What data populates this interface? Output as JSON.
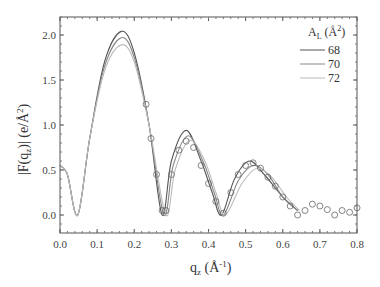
{
  "chart_data": {
    "type": "line",
    "title": "",
    "xlabel": "q_z (Å^-1)",
    "ylabel": "|F(q_z)| (e/Å^2)",
    "xlim": [
      0.0,
      0.8
    ],
    "ylim": [
      -0.2,
      2.2
    ],
    "x_ticks": [
      "0.0",
      "0.1",
      "0.2",
      "0.3",
      "0.4",
      "0.5",
      "0.6",
      "0.7",
      "0.8"
    ],
    "y_ticks": [
      "0.0",
      "0.5",
      "1.0",
      "1.5",
      "2.0"
    ],
    "grid": false,
    "legend": {
      "title": "A_L (Å^2)",
      "position": "upper right",
      "entries": [
        "68",
        "70",
        "72"
      ]
    },
    "series": [
      {
        "name": "68",
        "style": "line",
        "color": "#555555",
        "x": [
          0.0,
          0.02,
          0.048,
          0.08,
          0.12,
          0.165,
          0.2,
          0.24,
          0.275,
          0.3,
          0.34,
          0.38,
          0.41,
          0.435,
          0.47,
          0.51,
          0.55,
          0.6,
          0.64
        ],
        "y": [
          0.55,
          0.45,
          0.0,
          0.85,
          1.7,
          2.04,
          1.8,
          1.0,
          0.0,
          0.6,
          0.94,
          0.6,
          0.25,
          0.0,
          0.4,
          0.6,
          0.45,
          0.2,
          0.05
        ]
      },
      {
        "name": "70",
        "style": "line",
        "color": "#888888",
        "x": [
          0.0,
          0.02,
          0.048,
          0.08,
          0.12,
          0.165,
          0.2,
          0.24,
          0.28,
          0.305,
          0.345,
          0.385,
          0.415,
          0.44,
          0.48,
          0.52,
          0.56,
          0.6,
          0.64
        ],
        "y": [
          0.55,
          0.45,
          0.0,
          0.85,
          1.65,
          1.97,
          1.75,
          1.0,
          0.0,
          0.55,
          0.88,
          0.6,
          0.25,
          0.0,
          0.38,
          0.55,
          0.45,
          0.2,
          0.05
        ]
      },
      {
        "name": "72",
        "style": "line",
        "color": "#bbbbbb",
        "x": [
          0.0,
          0.02,
          0.048,
          0.08,
          0.12,
          0.165,
          0.2,
          0.24,
          0.285,
          0.31,
          0.35,
          0.39,
          0.42,
          0.445,
          0.49,
          0.53,
          0.57,
          0.61,
          0.645
        ],
        "y": [
          0.55,
          0.45,
          0.0,
          0.85,
          1.6,
          1.89,
          1.7,
          1.0,
          0.0,
          0.5,
          0.83,
          0.6,
          0.25,
          0.0,
          0.35,
          0.52,
          0.42,
          0.2,
          0.05
        ]
      },
      {
        "name": "data",
        "style": "scatter-open-circle",
        "color": "#666666",
        "x": [
          0.232,
          0.245,
          0.26,
          0.275,
          0.285,
          0.3,
          0.32,
          0.34,
          0.36,
          0.38,
          0.4,
          0.42,
          0.44,
          0.46,
          0.48,
          0.5,
          0.52,
          0.54,
          0.56,
          0.58,
          0.6,
          0.62,
          0.64,
          0.66,
          0.68,
          0.7,
          0.72,
          0.74,
          0.76,
          0.78,
          0.8
        ],
        "y": [
          1.23,
          0.85,
          0.45,
          0.05,
          0.05,
          0.45,
          0.72,
          0.82,
          0.75,
          0.55,
          0.35,
          0.15,
          0.02,
          0.25,
          0.45,
          0.55,
          0.58,
          0.52,
          0.42,
          0.32,
          0.2,
          0.1,
          0.0,
          0.05,
          0.12,
          0.1,
          0.06,
          0.0,
          0.05,
          0.03,
          0.08
        ]
      }
    ]
  }
}
